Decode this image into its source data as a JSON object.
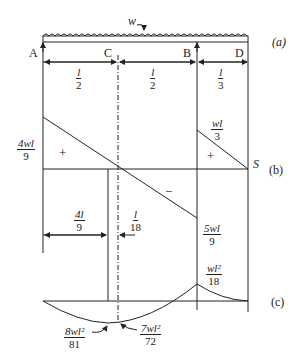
{
  "figure": {
    "load_label": "w",
    "panel_labels": {
      "a": "(a)",
      "b": "(b)",
      "c": "(c)"
    },
    "supports": {
      "A": "A",
      "C": "C",
      "B": "B",
      "D": "D"
    },
    "spans": [
      {
        "num": "l",
        "den": "2"
      },
      {
        "num": "l",
        "den": "2"
      },
      {
        "num": "l",
        "den": "3"
      }
    ],
    "shear": {
      "left_value": {
        "num": "4wl",
        "den": "9"
      },
      "b_right_value": {
        "num": "wl",
        "den": "3"
      },
      "b_left_value": {
        "num": "5wl",
        "den": "9"
      },
      "end_label": "S",
      "plus_sign": "+",
      "minus_sign": "−",
      "zero_dist": {
        "num": "4l",
        "den": "9"
      },
      "offset_dist": {
        "num": "l",
        "den": "18"
      }
    },
    "moment": {
      "max_sag": {
        "num": "8wl²",
        "den": "81"
      },
      "at_c": {
        "num": "7wl²",
        "den": "72"
      },
      "at_b": {
        "num": "wl²",
        "den": "18"
      }
    }
  }
}
